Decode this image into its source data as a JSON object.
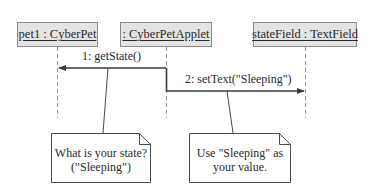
{
  "diagram": {
    "type": "uml-sequence-diagram",
    "objects": [
      {
        "id": "pet1",
        "label": "pet1 : CyberPet"
      },
      {
        "id": "applet",
        "label": ": CyberPetApplet"
      },
      {
        "id": "field",
        "label": "stateField : TextField"
      }
    ],
    "messages": [
      {
        "label": "1: getState()",
        "from": ": CyberPetApplet",
        "to": "pet1 : CyberPet"
      },
      {
        "label": "2: setText(\"Sleeping\")",
        "from": ": CyberPetApplet",
        "to": "stateField : TextField"
      }
    ],
    "notes": [
      {
        "lines": [
          "What is your state?",
          "(\"Sleeping\")"
        ],
        "attached_to": "1: getState()"
      },
      {
        "lines": [
          "Use \"Sleeping\" as",
          "your value."
        ],
        "attached_to": "2: setText(\"Sleeping\")"
      }
    ],
    "colors": {
      "object_fill": "#e4e4e4",
      "object_border": "#8a8a8a",
      "line": "#4a4a4a",
      "lifeline": "#9a9a9a",
      "text": "#2a2a2a"
    }
  }
}
